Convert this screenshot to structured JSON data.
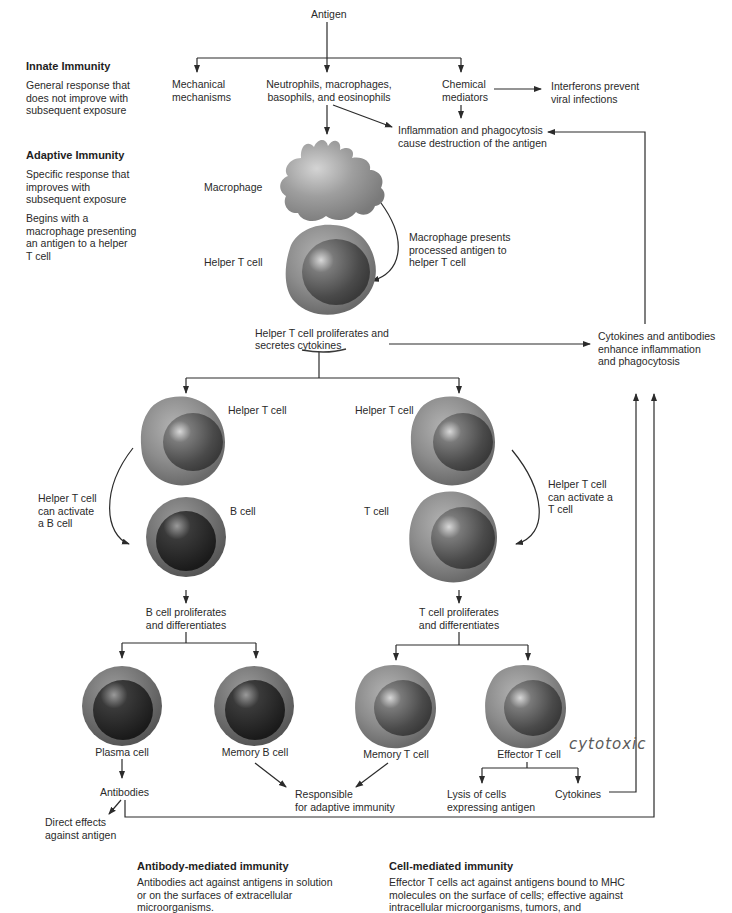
{
  "sidebar": {
    "innate": {
      "title": "Innate Immunity",
      "description": "General response that\ndoes not improve with\nsubsequent exposure"
    },
    "adaptive": {
      "title": "Adaptive Immunity",
      "description": "Specific response that\nimproves with\nsubsequent exposure",
      "note": "Begins with a\nmacrophage presenting\nan antigen to a helper\nT cell"
    }
  },
  "innate_flow": {
    "antigen": "Antigen",
    "mechanical": "Mechanical\nmechanisms",
    "phagocytes": "Neutrophils, macrophages,\nbasophils, and eosinophils",
    "chemical": "Chemical\nmediators",
    "interferons": "Interferons prevent\nviral infections",
    "inflammation": "Inflammation and phagocytosis\ncause destruction of the antigen"
  },
  "adaptive_flow": {
    "macrophage_label": "Macrophage",
    "helper_t_label": "Helper T cell",
    "presents_note": "Macrophage presents\nprocessed antigen to\nhelper T cell",
    "helper_proliferates_1": "Helper T cell proliferates and",
    "helper_proliferates_2_prefix": "secretes ",
    "helper_proliferates_2_word": "cytokines",
    "cytokines_enhance": "Cytokines and antibodies\nenhance inflammation\nand phagocytosis"
  },
  "b_branch": {
    "helper_t_label": "Helper T cell",
    "activate_note": "Helper T cell\ncan activate\na B cell",
    "b_cell_label": "B cell",
    "proliferates": "B cell proliferates\nand differentiates",
    "plasma_cell": "Plasma cell",
    "memory_b_cell": "Memory B cell",
    "antibodies": "Antibodies",
    "direct_effects": "Direct effects\nagainst antigen"
  },
  "t_branch": {
    "helper_t_label": "Helper T cell",
    "activate_note": "Helper T cell\ncan activate a\nT cell",
    "t_cell_label": "T cell",
    "proliferates": "T cell proliferates\nand differentiates",
    "memory_t_cell": "Memory T cell",
    "effector_t_cell": "Effector T cell",
    "handwritten_note": "cytotoxic",
    "lysis": "Lysis of cells\nexpressing antigen",
    "cytokines": "Cytokines"
  },
  "shared": {
    "responsible": "Responsible\nfor adaptive immunity"
  },
  "footer": {
    "antibody_mediated": {
      "title": "Antibody-mediated immunity",
      "description": "Antibodies act against antigens in solution\nor on the surfaces of extracellular\nmicroorganisms."
    },
    "cell_mediated": {
      "title": "Cell-mediated immunity",
      "description": "Effector T cells act against antigens bound to MHC\nmolecules on the surface of cells; effective against\nintracellular microorganisms, tumors, and"
    }
  },
  "colors": {
    "line": "#2b2b2b",
    "cell_outer": "#8a8a8a",
    "cell_nucleus": "#4a4a4a",
    "b_cell_outer": "#6e6e6e",
    "b_cell_nucleus": "#262626",
    "text": "#2a2a2a"
  }
}
